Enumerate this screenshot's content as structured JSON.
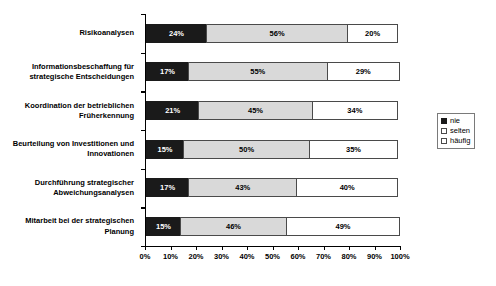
{
  "chart_data": {
    "type": "bar",
    "subtype": "stacked-horizontal-100",
    "title": "",
    "xlabel": "",
    "ylabel": "",
    "xlim": [
      0,
      100
    ],
    "xticks": [
      "0%",
      "10%",
      "20%",
      "30%",
      "40%",
      "50%",
      "60%",
      "70%",
      "80%",
      "90%",
      "100%"
    ],
    "grid": false,
    "legend_position": "right",
    "categories": [
      "Risikoanalysen",
      "Informationsbeschaffung für strategische Entscheidungen",
      "Koordination der betrieblichen Früherkennung",
      "Beurteilung von Investitionen und Innovationen",
      "Durchführung strategischer Abweichungsanalysen",
      "Mitarbeit bei der strategischen Planung"
    ],
    "series": [
      {
        "name": "nie",
        "values": [
          24,
          17,
          21,
          15,
          17,
          15
        ]
      },
      {
        "name": "selten",
        "values": [
          56,
          55,
          45,
          50,
          43,
          46
        ]
      },
      {
        "name": "häufig",
        "values": [
          20,
          29,
          34,
          35,
          40,
          49
        ]
      }
    ],
    "data_labels": [
      [
        "24%",
        "56%",
        "20%"
      ],
      [
        "17%",
        "55%",
        "29%"
      ],
      [
        "21%",
        "45%",
        "34%"
      ],
      [
        "15%",
        "50%",
        "35%"
      ],
      [
        "17%",
        "43%",
        "40%"
      ],
      [
        "15%",
        "46%",
        "49%"
      ]
    ],
    "colors": {
      "nie": "#1a1a1a",
      "selten": "#d9d9d9",
      "haeufig": "#ffffff",
      "axis": "#000000",
      "border": "#4a4a4a"
    }
  },
  "legend": {
    "items": [
      {
        "label": "nie"
      },
      {
        "label": "selten"
      },
      {
        "label": "häufig"
      }
    ]
  }
}
